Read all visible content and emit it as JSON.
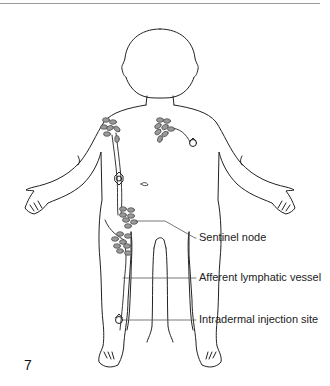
{
  "figure": {
    "number": "7",
    "labels": [
      {
        "id": "sentinel-node",
        "text": "Sentinel node"
      },
      {
        "id": "afferent-lymphatic-vessel",
        "text": "Afferent lymphatic vessel"
      },
      {
        "id": "intradermal-injection-site",
        "text": "Intradermal injection site"
      }
    ],
    "colors": {
      "outline": "#222222",
      "node_fill": "#9a9a9a",
      "node_stroke": "#444444",
      "leader": "#555555",
      "rule": "#9a9a9a"
    }
  }
}
